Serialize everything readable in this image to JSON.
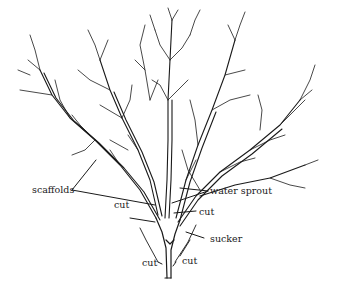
{
  "diagram": {
    "labels": {
      "scaffolds": "scaffolds",
      "water_sprout": "water sprout",
      "cut_left_upper": "cut",
      "cut_right_upper": "cut",
      "sucker": "sucker",
      "cut_bottom_left": "cut",
      "cut_bottom_right": "cut"
    },
    "colors": {
      "ink": "#1a1a1a",
      "background": "#ffffff"
    }
  }
}
